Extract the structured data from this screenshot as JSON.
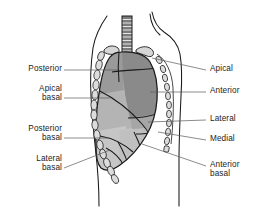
{
  "figure": {
    "view": "lateral chest with ribcage, trachea and segmented lung"
  },
  "colors": {
    "background": "#ffffff",
    "outline": "#1a1a1a",
    "upper_segment_fill": "#8d8d8d",
    "mid_segment_fill": "#a8a8a8",
    "lower_segment_fill": "#c4c4c4",
    "lower_segment_fill_alt": "#bdbdbd",
    "rib_fill": "#d8d8d8",
    "trachea_fill": "#6f6f6f",
    "leader_line": "#5a5a5a",
    "text": "#1c1c1c"
  },
  "labels": {
    "left": [
      {
        "id": "posterior",
        "text": "Posterior",
        "lines": [
          "Posterior"
        ],
        "x": 14,
        "y": 64,
        "width": 48,
        "leader": {
          "x1": 64,
          "y1": 70,
          "x2": 118,
          "y2": 70
        }
      },
      {
        "id": "apical-basal",
        "text": "Apical basal",
        "lines": [
          "Apical",
          "basal"
        ],
        "x": 14,
        "y": 84,
        "width": 48,
        "leader": {
          "x1": 64,
          "y1": 98,
          "x2": 110,
          "y2": 98
        }
      },
      {
        "id": "posterior-basal",
        "text": "Posterior basal",
        "lines": [
          "Posterior",
          "basal"
        ],
        "x": 8,
        "y": 124,
        "width": 54,
        "leader": {
          "x1": 64,
          "y1": 138,
          "x2": 108,
          "y2": 138
        }
      },
      {
        "id": "lateral-basal",
        "text": "Lateral basal",
        "lines": [
          "Lateral",
          "basal"
        ],
        "x": 14,
        "y": 154,
        "width": 48,
        "leader": {
          "x1": 64,
          "y1": 168,
          "x2": 110,
          "y2": 150
        }
      }
    ],
    "right": [
      {
        "id": "apical",
        "text": "Apical",
        "lines": [
          "Apical"
        ],
        "x": 210,
        "y": 64,
        "width": 56,
        "leader": {
          "x1": 206,
          "y1": 70,
          "x2": 152,
          "y2": 58
        }
      },
      {
        "id": "anterior",
        "text": "Anterior",
        "lines": [
          "Anterior"
        ],
        "x": 210,
        "y": 86,
        "width": 56,
        "leader": {
          "x1": 206,
          "y1": 92,
          "x2": 150,
          "y2": 92
        }
      },
      {
        "id": "lateral",
        "text": "Lateral",
        "lines": [
          "Lateral"
        ],
        "x": 210,
        "y": 114,
        "width": 56,
        "leader": {
          "x1": 206,
          "y1": 120,
          "x2": 148,
          "y2": 122
        }
      },
      {
        "id": "medial",
        "text": "Medial",
        "lines": [
          "Medial"
        ],
        "x": 210,
        "y": 134,
        "width": 56,
        "leader": {
          "x1": 206,
          "y1": 140,
          "x2": 158,
          "y2": 132
        }
      },
      {
        "id": "anterior-basal",
        "text": "Anterior basal",
        "lines": [
          "Anterior",
          "basal"
        ],
        "x": 210,
        "y": 160,
        "width": 58,
        "leader": {
          "x1": 206,
          "y1": 166,
          "x2": 142,
          "y2": 144
        }
      }
    ]
  }
}
